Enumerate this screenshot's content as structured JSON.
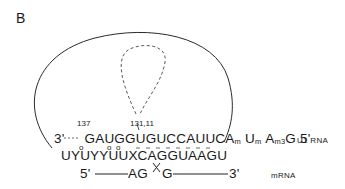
{
  "panel": {
    "label": "B"
  },
  "u1_rna": {
    "three_prime": "3'",
    "dots": "....",
    "sequence_main": "GAUGGUGUCCAUUCA",
    "mod_A": "m",
    "base_U": "U",
    "mod_U": "m",
    "base_A2": "A",
    "mod_A2": "m3",
    "base_G": "G",
    "five_prime": "5'",
    "label": "U1 RNA",
    "position_137": "137",
    "position_131_11": "131,11"
  },
  "intron_consensus": {
    "sequence": "UYUYYUUXCAGGUAAGU",
    "wobble_marks": "o",
    "wobble_positions": [
      3,
      6,
      7
    ]
  },
  "mrna": {
    "five_prime": "5'",
    "exon_left_end": "AG",
    "exon_right_start": "G",
    "three_prime": "3'",
    "label": "mRNA",
    "splice_mark": "X"
  }
}
